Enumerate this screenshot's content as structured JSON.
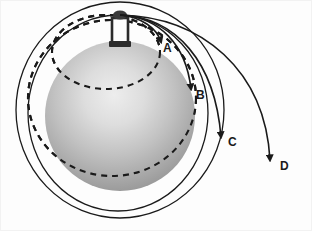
{
  "figure": {
    "background_color": "#fdfdfd",
    "border_color": "#f2f2f2",
    "stroke_color": "#1a1a1a",
    "planet": {
      "name": "earth-sphere",
      "center_x": 120,
      "center_y": 116,
      "radius": 75,
      "highlight_color": "#ededed",
      "mid_color": "#b9b9b9",
      "edge_color": "#8e8e8e"
    },
    "tower": {
      "name": "launch-tower",
      "x": 112,
      "y": 16,
      "width": 16,
      "height": 30,
      "color": "#2b2b2b",
      "cap_color": "#3a3a3a",
      "launch_point_x": 120,
      "launch_point_y": 15
    },
    "trajectories": [
      {
        "id": "A",
        "label": "A",
        "label_x": 163,
        "label_y": 52,
        "description": "shortest projectile arc, falls back to surface",
        "path": "M120,15 C141,17 157,28 161,46",
        "arrow_x": 159,
        "arrow_y": 40,
        "arrow_rotation": 80
      },
      {
        "id": "B",
        "label": "B",
        "label_x": 196,
        "label_y": 99,
        "description": "longer projectile arc, lands farther around the globe",
        "path": "M120,15 C159,17 186,44 191,93",
        "arrow_x": 190,
        "arrow_y": 86,
        "arrow_rotation": 84
      },
      {
        "id": "C",
        "label": "C",
        "label_x": 228,
        "label_y": 146,
        "description": "grazing arc nearly reaching orbit",
        "path": "M120,15 C176,17 215,62 221,141",
        "arrow_x": 220,
        "arrow_y": 134,
        "arrow_rotation": 86
      },
      {
        "id": "D",
        "label": "D",
        "label_x": 280,
        "label_y": 170,
        "description": "fastest launch, longest arc escaping far from the globe",
        "path": "M120,15 C202,17 265,70 270,164",
        "arrow_x": 270,
        "arrow_y": 157,
        "arrow_rotation": 88
      }
    ],
    "orbits": [
      {
        "id": "orbit-inner-solid",
        "style": "solid",
        "description": "closed elliptical orbit passing just outside the globe",
        "cx": 118,
        "cy": 113,
        "rx": 90,
        "ry": 98
      },
      {
        "id": "orbit-outer-solid",
        "style": "solid",
        "description": "larger closed elliptical orbit",
        "cx": 120,
        "cy": 110,
        "rx": 104,
        "ry": 108
      },
      {
        "id": "orbit-inner-dashed",
        "style": "dashed",
        "description": "dashed return path of trajectory A behind the globe",
        "cx": 106,
        "cy": 52,
        "rx": 54,
        "ry": 37
      },
      {
        "id": "orbit-outer-dashed",
        "style": "dashed",
        "description": "dashed return path of trajectory B behind the globe",
        "cx": 112,
        "cy": 98,
        "rx": 84,
        "ry": 78
      }
    ]
  }
}
